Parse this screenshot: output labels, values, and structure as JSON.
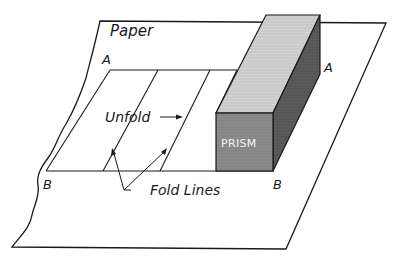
{
  "diagram": {
    "labels": {
      "paper": "Paper",
      "corner_a_left": "A",
      "corner_a_right": "A",
      "corner_b_left": "B",
      "corner_b_right": "B",
      "unfold": "Unfold",
      "fold_lines": "Fold Lines",
      "prism": "PRISM"
    },
    "colors": {
      "line": "#1a1a1a",
      "prism_top": "#cfcfcf",
      "prism_front": "#8a8a8a",
      "prism_side": "#5a5a5a",
      "background": "#ffffff"
    }
  }
}
